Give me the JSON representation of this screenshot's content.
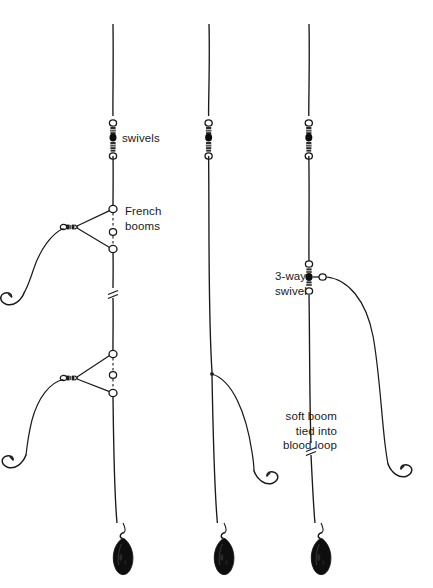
{
  "diagram": {
    "background_color": "#ffffff",
    "line_color": "#1a1a1a",
    "weight_color": "#111111",
    "labels": [
      {
        "id": "swivels",
        "text": "swivels",
        "x": 122,
        "y": 131,
        "align": "left"
      },
      {
        "id": "french_booms",
        "text": "French\nbooms",
        "x": 125,
        "y": 204,
        "align": "left"
      },
      {
        "id": "three_way",
        "text": "3-way\nswivel",
        "x": 275,
        "y": 269,
        "align": "left"
      },
      {
        "id": "soft_boom",
        "text": "soft boom\ntied into\nblood loop",
        "x": 253,
        "y": 409,
        "align": "right"
      }
    ],
    "rigs": [
      {
        "id": "rig-french-boom",
        "name": "French boom rig",
        "main_line_x": 113,
        "components": [
          "swivel-stack",
          "french-boom-upper",
          "line-break",
          "french-boom-lower",
          "hook",
          "hook",
          "teardrop-weight"
        ]
      },
      {
        "id": "rig-paternoster",
        "name": "Plain paternoster rig",
        "main_line_x": 209,
        "components": [
          "swivel-stack",
          "line-break",
          "branch-line",
          "hook",
          "teardrop-weight"
        ]
      },
      {
        "id": "rig-soft-boom",
        "name": "Soft boom / 3-way swivel rig",
        "main_line_x": 309,
        "components": [
          "swivel-stack",
          "three-way-swivel",
          "soft-boom-branch",
          "line-break",
          "hook",
          "teardrop-weight"
        ]
      }
    ]
  }
}
